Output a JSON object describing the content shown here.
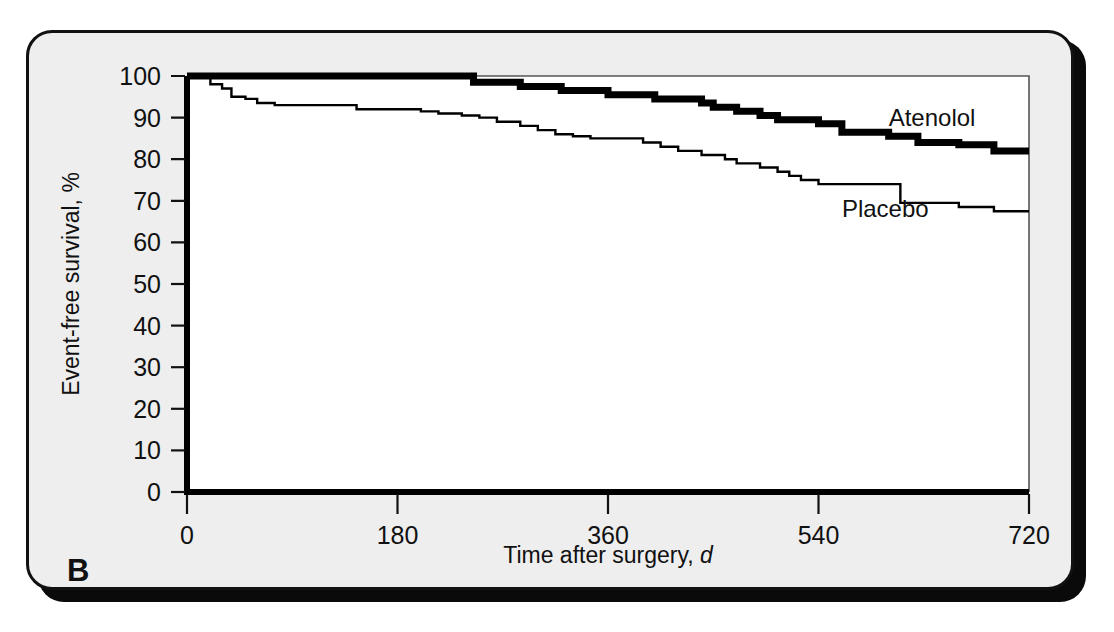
{
  "figure": {
    "panel_letter": "B",
    "background_color": "#eeeeee",
    "plot_background_color": "#ffffff",
    "line_color": "#000000"
  },
  "chart_data": {
    "type": "line",
    "subtype": "kaplan-meier-step",
    "title": "",
    "xlabel": "Time after surgery, d",
    "ylabel": "Event-free survival, %",
    "xlim": [
      0,
      720
    ],
    "ylim": [
      0,
      100
    ],
    "xticks": [
      0,
      180,
      360,
      540,
      720
    ],
    "xtick_labels": [
      "0",
      "180",
      "360",
      "540",
      "720"
    ],
    "yticks": [
      0,
      10,
      20,
      30,
      40,
      50,
      60,
      70,
      80,
      90,
      100
    ],
    "ytick_labels": [
      "0",
      "10",
      "20",
      "30",
      "40",
      "50",
      "60",
      "70",
      "80",
      "90",
      "100"
    ],
    "grid": false,
    "legend_position": "inline-annotation",
    "series": [
      {
        "name": "Atenolol",
        "style": "thick",
        "label_x": 600,
        "label_y": 88,
        "x": [
          0,
          235,
          245,
          275,
          285,
          300,
          320,
          345,
          360,
          385,
          400,
          415,
          440,
          450,
          470,
          490,
          505,
          540,
          560,
          600,
          625,
          660,
          690,
          720
        ],
        "y": [
          100,
          100,
          98.5,
          98.5,
          97.5,
          97.5,
          96.5,
          96.5,
          95.5,
          95.5,
          94.5,
          94.5,
          93.5,
          92.5,
          91.5,
          90.5,
          89.5,
          88.5,
          86.5,
          85.5,
          84.0,
          83.5,
          82.0,
          82.0
        ]
      },
      {
        "name": "Placebo",
        "style": "thin",
        "label_x": 560,
        "label_y": 66,
        "x": [
          0,
          12,
          20,
          30,
          38,
          50,
          60,
          75,
          90,
          120,
          145,
          175,
          200,
          215,
          235,
          250,
          265,
          285,
          300,
          315,
          330,
          345,
          360,
          375,
          390,
          405,
          420,
          440,
          460,
          470,
          490,
          505,
          515,
          525,
          540,
          560,
          580,
          610,
          640,
          660,
          690,
          720
        ],
        "y": [
          100,
          100,
          98.0,
          97.0,
          95.0,
          94.5,
          93.5,
          93.0,
          93.0,
          93.0,
          92.0,
          92.0,
          91.5,
          91.0,
          90.5,
          90.0,
          89.0,
          88.0,
          87.0,
          86.0,
          85.5,
          85.0,
          85.0,
          85.0,
          84.0,
          83.0,
          82.0,
          81.0,
          80.0,
          79.0,
          78.0,
          77.0,
          76.0,
          75.0,
          74.0,
          74.0,
          74.0,
          69.5,
          69.5,
          68.5,
          67.5,
          67.5
        ]
      }
    ]
  }
}
